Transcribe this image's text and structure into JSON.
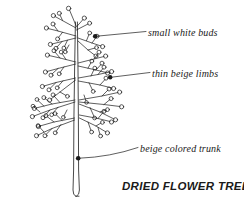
{
  "figure": {
    "title": "DRIED FLOWER TREE",
    "background_color": "#ffffff",
    "ink_color": "#1a1a1a",
    "annotations": [
      {
        "id": "buds",
        "text": "small white buds",
        "anchor_x": 95,
        "anchor_y": 36,
        "label_x": 148,
        "label_y": 32
      },
      {
        "id": "limbs",
        "text": "thin beige limbs",
        "anchor_x": 110,
        "anchor_y": 77,
        "label_x": 152,
        "label_y": 73
      },
      {
        "id": "trunk",
        "text": "beige colored trunk",
        "anchor_x": 78,
        "anchor_y": 158,
        "label_x": 140,
        "label_y": 148
      }
    ],
    "tree": {
      "trunk": {
        "top_y": 22,
        "base_y": 196,
        "center_x": 77,
        "top_width": 1.4,
        "base_width": 5.0
      },
      "bud_count": 62,
      "bud_radius": 2.1,
      "branch_tiers": 6
    }
  }
}
